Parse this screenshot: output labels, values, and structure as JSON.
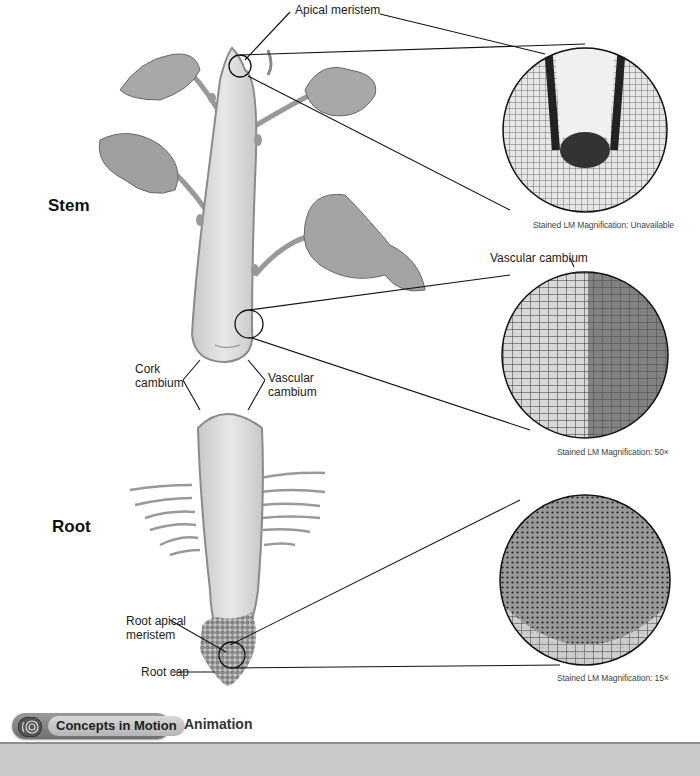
{
  "sections": {
    "stem": "Stem",
    "root": "Root"
  },
  "labels": {
    "apical_meristem": "Apical meristem",
    "vascular_cambium_top": "Vascular cambium",
    "cork_cambium_line1": "Cork",
    "cork_cambium_line2": "cambium",
    "vascular_cambium_line1": "Vascular",
    "vascular_cambium_line2": "cambium",
    "root_apical_line1": "Root apical",
    "root_apical_line2": "meristem",
    "root_cap": "Root cap"
  },
  "micrographs": [
    {
      "caption": "Stained LM Magnification: Unavailable",
      "subject": "apical-meristem"
    },
    {
      "caption": "Stained LM Magnification: 50×",
      "subject": "vascular-cambium"
    },
    {
      "caption": "Stained LM Magnification: 15×",
      "subject": "root-apical-meristem"
    }
  ],
  "footer": {
    "concepts_button": "Concepts in Motion",
    "animation_link": "Animation",
    "icon": "concentric-circles-icon"
  },
  "colors": {
    "plant_fill": "#d9d9d9",
    "plant_stroke": "#8a8a8a",
    "footer_bar": "#c9c9c9",
    "button_dark": "#6f6f6f"
  }
}
